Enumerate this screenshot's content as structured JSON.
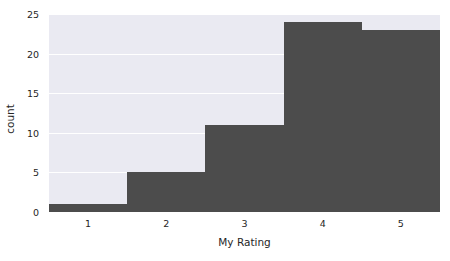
{
  "chart_data": {
    "type": "bar",
    "title": "",
    "xlabel": "My Rating",
    "ylabel": "count",
    "categories": [
      "1",
      "2",
      "3",
      "4",
      "5"
    ],
    "values": [
      1,
      5,
      11,
      24,
      23
    ],
    "x": [
      1,
      2,
      3,
      4,
      5
    ],
    "xlim": [
      0.5,
      5.5
    ],
    "ylim": [
      0,
      25
    ],
    "xticks": [
      "1",
      "2",
      "3",
      "4",
      "5"
    ],
    "yticks": [
      "0",
      "5",
      "10",
      "15",
      "20",
      "25"
    ],
    "ytick_values": [
      0,
      5,
      10,
      15,
      20,
      25
    ],
    "grid": "horizontal-white-on-gray",
    "legend": "none",
    "bar_color": "#4c4c4c",
    "plot_background": "#eaeaf2",
    "figure_background": "#ffffff",
    "gridline_color": "#ffffff",
    "tick_label_color": "#262626",
    "bar_width_fraction": 1.0,
    "style": "seaborn-darkgrid-histogram"
  }
}
